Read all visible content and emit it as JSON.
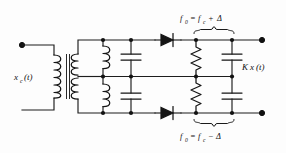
{
  "figure": {
    "kind": "circuit-schematic",
    "background_color": "#fdfdfd",
    "line_color": "#151515"
  },
  "labels": {
    "input": {
      "symbol": "x",
      "subscript": "c",
      "argument": "(t)",
      "text": "xc(t)"
    },
    "output": {
      "prefix": "K",
      "symbol": "x",
      "argument": "(t)",
      "text": "Kx(t)"
    },
    "upper_tuned_freq": {
      "lhs_symbol": "f",
      "lhs_subscript": "0",
      "equals": "=",
      "rhs_symbol": "f",
      "rhs_subscript": "c",
      "operator": "+",
      "delta": "Δ",
      "text": "f0 = fc + Δ"
    },
    "lower_tuned_freq": {
      "lhs_symbol": "f",
      "lhs_subscript": "0",
      "equals": "=",
      "rhs_symbol": "f",
      "rhs_subscript": "c",
      "operator": "−",
      "delta": "Δ",
      "text": "f0 = fc − Δ"
    }
  },
  "components": {
    "transformer": {
      "name": "center-tapped-transformer",
      "primary_turns": 3,
      "secondary_turns": 6,
      "center_tapped": true
    },
    "upper_branch": {
      "inductor": "L-upper",
      "capacitor": "C-upper",
      "diode": "D-upper",
      "resistor": "R-upper",
      "filter_capacitor": "Cf-upper"
    },
    "lower_branch": {
      "inductor": "L-lower",
      "capacitor": "C-lower",
      "diode": "D-lower",
      "resistor": "R-lower",
      "filter_capacitor": "Cf-lower"
    }
  },
  "terminals": {
    "input_terminal": "input-dot",
    "output_terminal_top": "output-dot-top",
    "output_terminal_bottom": "output-dot-bottom"
  }
}
